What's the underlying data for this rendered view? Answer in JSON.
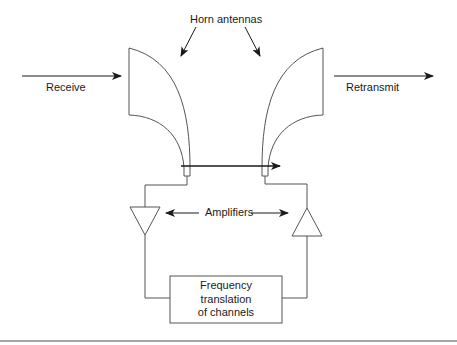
{
  "diagram": {
    "title_label": "Horn antennas",
    "input_label": "Receive",
    "output_label": "Retransmit",
    "amplifiers_label": "Amplifiers",
    "processor": {
      "lines": [
        "Frequency",
        "translation",
        "of channels"
      ]
    },
    "colors": {
      "line": "#555555",
      "arrow": "#1a1a1a",
      "text": "#1a1a1a",
      "separator": "#888888"
    }
  }
}
